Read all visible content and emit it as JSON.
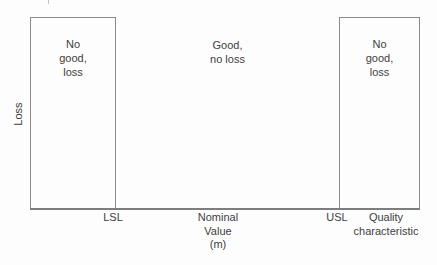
{
  "figure": {
    "y_axis_label": "Loss",
    "regions": {
      "left_box_text": "No\ngood,\nloss",
      "middle_text": "Good,\nno loss",
      "right_box_text": "No\ngood,\nloss"
    },
    "x_axis": {
      "lower_spec_limit_label": "LSL",
      "nominal_value_label": "Nominal\nValue\n(m)",
      "upper_spec_limit_label": "USL",
      "axis_title": "Quality\ncharacteristic"
    },
    "colors": {
      "background": "#fdfdfd",
      "box_border": "#8a8a8a",
      "axis_line": "#7d7d7d",
      "text": "#3e3e3e"
    }
  }
}
